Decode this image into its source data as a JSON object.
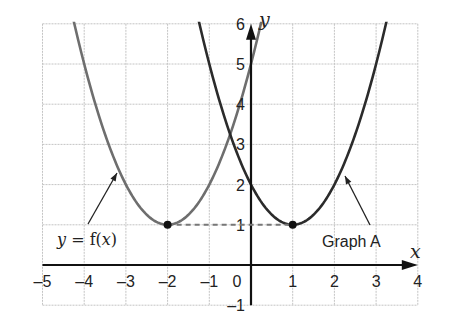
{
  "chart_data": {
    "type": "line",
    "title": "",
    "xlabel": "x",
    "ylabel": "y",
    "xlim": [
      -5,
      4
    ],
    "ylim": [
      -1,
      6
    ],
    "grid": true,
    "x_ticks": [
      "–5",
      "–4",
      "–3",
      "–2",
      "–1",
      "0",
      "1",
      "2",
      "3",
      "4"
    ],
    "y_ticks": [
      "–1",
      "1",
      "2",
      "3",
      "4",
      "5",
      "6"
    ],
    "series": [
      {
        "name": "y = f(x)",
        "label_text": "y = f(x)",
        "equation": "y = (x + 2)^2 + 1",
        "color": "#6e6e6e",
        "vertex": [
          -2,
          1
        ],
        "x": [
          -4.24,
          -4,
          -3.5,
          -3,
          -2.5,
          -2,
          -1.5,
          -1,
          -0.5,
          0,
          0.24
        ],
        "y": [
          6,
          5,
          3.25,
          2,
          1.25,
          1,
          1.25,
          2,
          3.25,
          5,
          6
        ]
      },
      {
        "name": "Graph A",
        "label_text": "Graph A",
        "equation": "y = (x - 1)^2 + 1",
        "color": "#2b2b2b",
        "vertex": [
          1,
          1
        ],
        "x": [
          -1.24,
          -1,
          -0.5,
          0,
          0.5,
          1,
          1.5,
          2,
          2.5,
          3,
          3.24
        ],
        "y": [
          6,
          5,
          3.25,
          2,
          1.25,
          1,
          1.25,
          2,
          3.25,
          5,
          6
        ]
      }
    ],
    "annotations": [
      {
        "type": "dashed-line",
        "from": [
          -2,
          1
        ],
        "to": [
          1,
          1
        ],
        "meaning": "translation of vertex"
      },
      {
        "type": "point",
        "at": [
          -2,
          1
        ]
      },
      {
        "type": "point",
        "at": [
          1,
          1
        ]
      },
      {
        "type": "arrow-label",
        "text": "y = f(x)",
        "points_to": [
          -3.2,
          3.5
        ]
      },
      {
        "type": "arrow-label",
        "text": "Graph A",
        "points_to": [
          2.2,
          2.3
        ]
      }
    ]
  },
  "labels": {
    "x_axis": "x",
    "y_axis": "y",
    "f_label_y": "y",
    "f_label_eq": " = f(",
    "f_label_x": "x",
    "f_label_close": ")",
    "graph_a": "Graph A"
  }
}
